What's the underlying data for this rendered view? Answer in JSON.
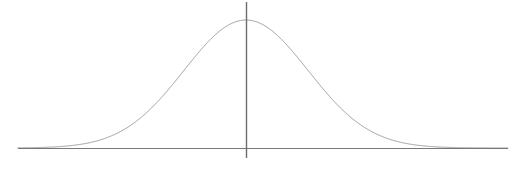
{
  "figure": {
    "title": "",
    "background_color": "#ffffff",
    "width": 523,
    "height": 171
  },
  "chart_data": {
    "type": "line",
    "title": "",
    "subtitle": "",
    "xlabel": "",
    "ylabel": "",
    "grid": false,
    "legend": null,
    "legend_position": "none",
    "annotations": [],
    "distribution": {
      "name": "normal",
      "mean_px": 246,
      "sigma_px": 62,
      "peak_y_px": 20,
      "baseline_y_px": 148,
      "amplitude_px": 128
    },
    "axes": {
      "x_axis": {
        "start_px": 18,
        "end_px": 508,
        "y_px": 148,
        "tick_labels": [],
        "xlim": [
          18,
          508
        ]
      },
      "y_axis": {
        "x_px": 246,
        "top_px": 2,
        "bottom_px": 158,
        "tick_labels": [],
        "ylim": [
          148,
          20
        ]
      }
    },
    "x": [
      18,
      38,
      58,
      78,
      98,
      118,
      138,
      158,
      178,
      198,
      218,
      238,
      246,
      254,
      274,
      294,
      314,
      334,
      354,
      374,
      394,
      414,
      434,
      454,
      474,
      494,
      508
    ],
    "y": [
      147.9,
      147.2,
      144.5,
      137.2,
      123.0,
      101.8,
      77.1,
      54.3,
      36.2,
      24.9,
      20.5,
      20.0,
      20.0,
      20.1,
      23.0,
      31.9,
      47.9,
      69.5,
      93.2,
      114.6,
      130.9,
      141.0,
      146.0,
      147.6,
      148.0,
      148.0,
      148.0
    ],
    "series": [
      {
        "name": "gaussian-curve",
        "color": "#9a9a9a",
        "line_width": 1.0
      }
    ]
  },
  "elements": {
    "baseline": {
      "name": "horizontal baseline axis",
      "color": "#787878",
      "line_width": 1.0
    },
    "mean_line": {
      "name": "vertical mean line",
      "color": "#6b6b6b",
      "line_width": 1.4
    },
    "bell_curve": {
      "name": "bell curve",
      "color": "#9a9a9a",
      "line_width": 1.0
    }
  },
  "colors": {
    "curve": "#9a9a9a",
    "baseline": "#787878",
    "mean_line": "#6b6b6b",
    "background": "#ffffff"
  }
}
